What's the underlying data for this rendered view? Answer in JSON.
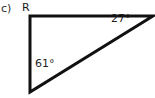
{
  "figure": {
    "part_label": "c)",
    "vertices": {
      "top_left_label": "R"
    },
    "angles": {
      "apex_right": "27°",
      "base_left": "61°"
    },
    "colors": {
      "background": "#ffffff",
      "stroke": "#111111",
      "text": "#1a1a1a"
    },
    "geometry": {
      "type": "right-triangle",
      "points": "30,16 153,16 30,92",
      "stroke_width": 3
    }
  }
}
